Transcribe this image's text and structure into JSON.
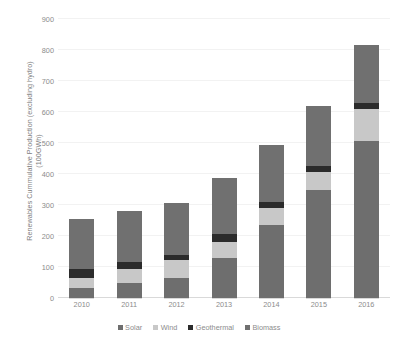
{
  "chart_data": {
    "type": "bar",
    "stacked": true,
    "title": "",
    "xlabel": "",
    "ylabel": "Renewables Cummulative Production (excluding hydro) (100GWh)",
    "ylabel_lines": [
      "Renewables Cummulative Production (excluding hydro)",
      "(100GWh)"
    ],
    "categories": [
      "2010",
      "2011",
      "2012",
      "2013",
      "2014",
      "2015",
      "2016"
    ],
    "ylim": [
      0,
      900
    ],
    "yticks": [
      0,
      100,
      200,
      300,
      400,
      500,
      600,
      700,
      800,
      900
    ],
    "ytick_labels": [
      "0",
      "100",
      "200",
      "300",
      "400",
      "500",
      "600",
      "700",
      "800",
      "900"
    ],
    "grid": true,
    "legend_position": "bottom",
    "series": [
      {
        "name": "Solar",
        "color": "#6e6e6e",
        "values": [
          32,
          48,
          64,
          130,
          235,
          348,
          508
        ]
      },
      {
        "name": "Wind",
        "color": "#c8c8c8",
        "values": [
          33,
          47,
          58,
          50,
          55,
          57,
          102
        ]
      },
      {
        "name": "Geothermal",
        "color": "#2b2b2b",
        "values": [
          28,
          20,
          16,
          25,
          20,
          20,
          20
        ]
      },
      {
        "name": "Biomass",
        "color": "#707070",
        "values": [
          162,
          165,
          169,
          183,
          184,
          195,
          185
        ]
      }
    ],
    "totals": [
      255,
      280,
      307,
      388,
      494,
      620,
      815
    ]
  },
  "legend": {
    "items": [
      {
        "label": "Solar",
        "color": "#6e6e6e"
      },
      {
        "label": "Wind",
        "color": "#c8c8c8"
      },
      {
        "label": "Geothermal",
        "color": "#2b2b2b"
      },
      {
        "label": "Biomass",
        "color": "#707070"
      }
    ]
  },
  "colors": {
    "background": "#ffffff",
    "gridline": "#f2f2f2",
    "axis": "#d9d9d9",
    "tick_text": "#8c8c8c",
    "axis_title_text": "#808080"
  }
}
